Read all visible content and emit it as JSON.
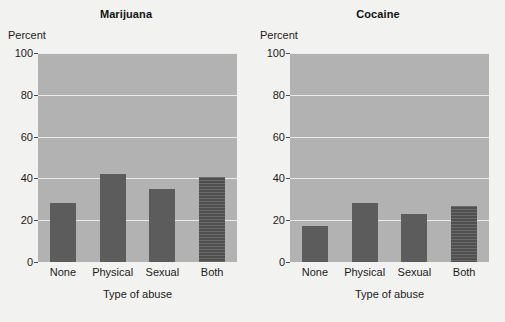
{
  "figure": {
    "background_color": "#f2f2f0",
    "plot_area_color": "#b2b2b2",
    "bar_color": "#5c5c5c",
    "gridline_color": "#ebebeb"
  },
  "panels": [
    {
      "title": "Marijuana",
      "ylabel": "Percent",
      "xlabel": "Type of abuse",
      "yticks": [
        "0",
        "20",
        "40",
        "60",
        "80",
        "100"
      ],
      "categories": [
        "None",
        "Physical",
        "Sexual",
        "Both"
      ]
    },
    {
      "title": "Cocaine",
      "ylabel": "Percent",
      "xlabel": "Type of abuse",
      "yticks": [
        "0",
        "20",
        "40",
        "60",
        "80",
        "100"
      ],
      "categories": [
        "None",
        "Physical",
        "Sexual",
        "Both"
      ]
    }
  ],
  "chart_data": [
    {
      "type": "bar",
      "title": "Marijuana",
      "xlabel": "Type of abuse",
      "ylabel": "Percent",
      "categories": [
        "None",
        "Physical",
        "Sexual",
        "Both"
      ],
      "values": [
        28,
        42,
        35,
        40.5
      ],
      "ylim": [
        0,
        100
      ],
      "yticks": [
        0,
        20,
        40,
        60,
        80,
        100
      ],
      "grid": true,
      "legend": "none",
      "bar_styles": [
        "solid",
        "solid",
        "solid",
        "hatched-horizontal"
      ]
    },
    {
      "type": "bar",
      "title": "Cocaine",
      "xlabel": "Type of abuse",
      "ylabel": "Percent",
      "categories": [
        "None",
        "Physical",
        "Sexual",
        "Both"
      ],
      "values": [
        17,
        28,
        23,
        27
      ],
      "ylim": [
        0,
        100
      ],
      "yticks": [
        0,
        20,
        40,
        60,
        80,
        100
      ],
      "grid": true,
      "legend": "none",
      "bar_styles": [
        "solid",
        "solid",
        "solid",
        "hatched-horizontal"
      ]
    }
  ]
}
